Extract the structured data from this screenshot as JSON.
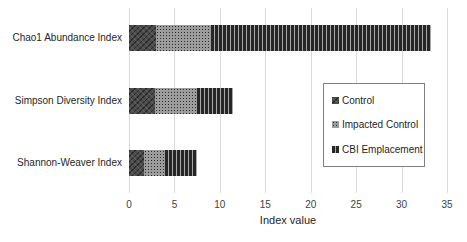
{
  "chart_data": {
    "type": "bar",
    "orientation": "horizontal-stacked",
    "title": "",
    "xlabel": "Index value",
    "ylabel": "",
    "xlim": [
      0,
      35
    ],
    "xticks": [
      0,
      5,
      10,
      15,
      20,
      25,
      30,
      35
    ],
    "grid": true,
    "legend_position": "inside-right",
    "categories": [
      "Chao1 Abundance Index",
      "Simpson Diversity Index",
      "Shannon-Weaver Index"
    ],
    "series": [
      {
        "name": "Control",
        "values": [
          3.0,
          2.9,
          1.7
        ],
        "pattern": "dark-diagonal-crosshatch",
        "color": "#4a4a4a"
      },
      {
        "name": "Impacted Control",
        "values": [
          6.0,
          4.6,
          2.3
        ],
        "pattern": "gray-dotted",
        "color": "#9c9c9c"
      },
      {
        "name": "CBI Emplacement",
        "values": [
          24.2,
          4.0,
          3.5
        ],
        "pattern": "vertical-stripes",
        "color": "#262626"
      }
    ],
    "totals": [
      33.2,
      11.5,
      7.5
    ]
  },
  "legend": {
    "border_color": "#808080",
    "background": "#ffffff"
  }
}
